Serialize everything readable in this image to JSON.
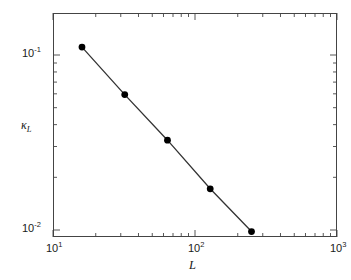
{
  "chart_data": {
    "type": "line",
    "title": "",
    "subtitle": "",
    "xlabel": "L",
    "ylabel": "kappa_L",
    "xlabel_display": "L",
    "ylabel_display": "κ",
    "ylabel_subscript": "L",
    "xscale": "log",
    "yscale": "log",
    "xlim": [
      10,
      1000
    ],
    "ylim": [
      0.01,
      0.2
    ],
    "grid": false,
    "legend": null,
    "legend_position": "none",
    "marker": "filled-circle",
    "marker_color": "#000000",
    "line_color": "#333333",
    "x_tick_labels": [
      "10¹",
      "10²",
      "10³"
    ],
    "x_tick_values": [
      10,
      100,
      1000
    ],
    "y_tick_labels": [
      "10⁻¹",
      "10⁻²"
    ],
    "y_tick_values": [
      0.1,
      0.01
    ],
    "x": [
      16,
      32,
      64,
      128,
      250
    ],
    "values": [
      0.111,
      0.0594,
      0.0326,
      0.0172,
      0.0098
    ],
    "series": [
      {
        "name": "kappa_L vs L",
        "x": [
          16,
          32,
          64,
          128,
          250
        ],
        "values": [
          0.111,
          0.0594,
          0.0326,
          0.0172,
          0.0098
        ]
      }
    ],
    "annotations": []
  },
  "axes": {
    "x": {
      "major_ticks": [
        {
          "label_mantissa": "10",
          "label_exponent": "1",
          "value": 10
        },
        {
          "label_mantissa": "10",
          "label_exponent": "2",
          "value": 100
        },
        {
          "label_mantissa": "10",
          "label_exponent": "3",
          "value": 1000
        }
      ],
      "title_text": "L"
    },
    "y": {
      "major_ticks": [
        {
          "label_mantissa": "10",
          "label_exponent": "-1",
          "value": 0.1
        },
        {
          "label_mantissa": "10",
          "label_exponent": "-2",
          "value": 0.01
        }
      ],
      "title_symbol": "κ",
      "title_subscript": "L"
    }
  },
  "figure": {
    "background_color": "#ffffff",
    "frame_color": "#444444",
    "text_color": "#1a1a1a",
    "cropped_header": ""
  }
}
